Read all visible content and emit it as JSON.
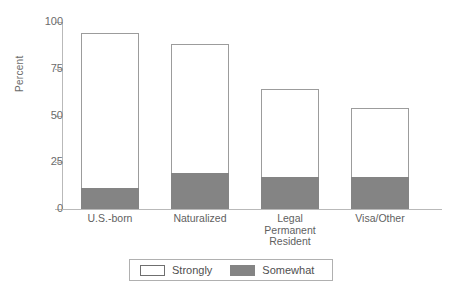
{
  "chart_data": {
    "type": "bar",
    "title": "",
    "xlabel": "",
    "ylabel": "Percent",
    "ylim": [
      0,
      100
    ],
    "yticks": [
      0,
      25,
      50,
      75,
      100
    ],
    "ytick_labels": [
      "0",
      "25",
      "50",
      "75",
      "100"
    ],
    "grid": false,
    "stacked": true,
    "legend_position": "bottom",
    "categories": [
      "U.S.-born",
      "Naturalized",
      "Legal Permanent Resident",
      "Visa/Other"
    ],
    "category_label_lines": [
      [
        "U.S.-born"
      ],
      [
        "Naturalized"
      ],
      [
        "Legal",
        "Permanent",
        "Resident"
      ],
      [
        "Visa/Other"
      ]
    ],
    "series": [
      {
        "name": "Somewhat",
        "color": "#848484",
        "values": [
          11,
          19,
          17,
          17
        ]
      },
      {
        "name": "Strongly",
        "color": "#ffffff",
        "values": [
          83,
          69,
          47,
          37
        ]
      }
    ],
    "totals": [
      94,
      88,
      64,
      54
    ],
    "legend": [
      {
        "label": "Strongly",
        "swatch": "open"
      },
      {
        "label": "Somewhat",
        "swatch": "filled"
      }
    ]
  },
  "colors": {
    "somewhat": "#848484",
    "strongly": "#ffffff",
    "axis": "#b9b9b9",
    "bar_outline": "#9c9c9c",
    "text": "#5f5f5f"
  }
}
